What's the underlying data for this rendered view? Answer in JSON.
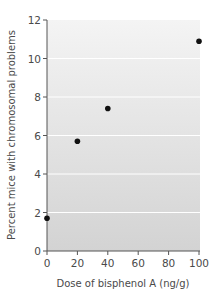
{
  "chart_data": {
    "type": "scatter",
    "title": "",
    "xlabel": "Dose of bisphenol A (ng/g)",
    "ylabel": "Percent mice with chromosomal problems",
    "x": [
      0,
      20,
      40,
      100
    ],
    "series": [
      {
        "name": "Percent mice with chromosomal problems",
        "values": [
          1.7,
          5.7,
          7.4,
          10.9
        ]
      }
    ],
    "xlim": [
      0,
      100
    ],
    "ylim": [
      0,
      12
    ],
    "xticks": [
      0,
      20,
      40,
      60,
      80,
      100
    ],
    "yticks": [
      0,
      2,
      4,
      6,
      8,
      10,
      12
    ],
    "xtick_labels": [
      "0",
      "20",
      "40",
      "60",
      "80",
      "100"
    ],
    "ytick_labels": [
      "0",
      "2",
      "4",
      "6",
      "8",
      "10",
      "12"
    ],
    "grid": true,
    "grid_color": "#ffffff",
    "legend": "none",
    "colors": {
      "marker": "#111111",
      "axis": "#555555",
      "plot_bg_top": "#f4f4f4",
      "plot_bg_bottom": "#d3d3d3"
    }
  }
}
